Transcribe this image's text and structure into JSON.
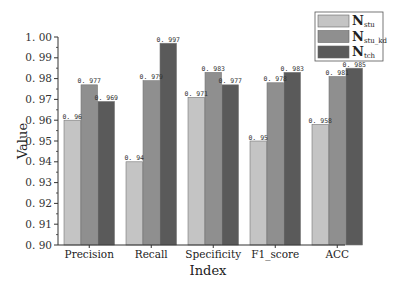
{
  "chart_data": {
    "type": "bar",
    "title": "",
    "xlabel": "Index",
    "ylabel": "Value",
    "ylim": [
      0.9,
      1.0
    ],
    "yticks": [
      "0.90",
      "0.91",
      "0.92",
      "0.93",
      "0.94",
      "0.95",
      "0.96",
      "0.97",
      "0.98",
      "0.99",
      "1.00"
    ],
    "categories": [
      "Precision",
      "Recall",
      "Specificity",
      "F1_score",
      "ACC"
    ],
    "series": [
      {
        "name": "N_stu",
        "label_main": "N",
        "label_sub": "stu",
        "color": "#c4c4c4",
        "values": [
          0.96,
          0.94,
          0.971,
          0.95,
          0.958
        ]
      },
      {
        "name": "N_stu_kd",
        "label_main": "N",
        "label_sub": "stu_kd",
        "color": "#8f8f8f",
        "values": [
          0.977,
          0.979,
          0.983,
          0.978,
          0.981
        ]
      },
      {
        "name": "N_tch",
        "label_main": "N",
        "label_sub": "tch",
        "color": "#5a5a5a",
        "values": [
          0.969,
          0.997,
          0.977,
          0.983,
          0.985
        ]
      }
    ],
    "value_labels": [
      [
        "0.96",
        "0.94",
        "0.971",
        "0.95",
        "0.958"
      ],
      [
        "0.977",
        "0.979",
        "0.983",
        "0.978",
        "0.981"
      ],
      [
        "0.969",
        "0.997",
        "0.977",
        "0.983",
        "0.985"
      ]
    ],
    "grid": false,
    "legend_position": "top-right"
  }
}
